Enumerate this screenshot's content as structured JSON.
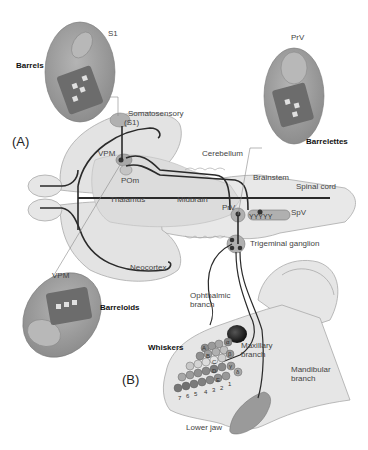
{
  "figure": {
    "panels": {
      "a": "(A)",
      "b": "(B)"
    },
    "insets": {
      "s1": {
        "region_label": "S1",
        "structure_label": "Barrels"
      },
      "prv": {
        "region_label": "PrV",
        "structure_label": "Barrelettes"
      },
      "vpm": {
        "region_label": "VPM",
        "structure_label": "Barreloids"
      }
    },
    "brain_labels": {
      "somatosensory": "Somatosensory",
      "s1": "(S1)",
      "vpm": "VPM",
      "pom": "POm",
      "thalamus": "Thalamus",
      "midbrain": "Midbrain",
      "cerebellum": "Cerebellum",
      "brainstem": "Brainstem",
      "spinal_cord": "Spinal cord",
      "prv": "PrV",
      "spv": "SpV",
      "neocortex": "Neocortex",
      "trigeminal_ganglion": "Trigeminal ganglion"
    },
    "head_labels": {
      "ophthalmic_1": "Ophthalmic",
      "ophthalmic_2": "branch",
      "whiskers": "Whiskers",
      "maxillary_1": "Maxillary",
      "maxillary_2": "branch",
      "mandibular_1": "Mandibular",
      "mandibular_2": "branch",
      "lower_jaw": "Lower jaw"
    },
    "whisker_rows": [
      "A",
      "B",
      "C",
      "D",
      "E"
    ],
    "whisker_arcs": [
      "1",
      "2",
      "3",
      "4",
      "5",
      "6",
      "7"
    ],
    "straddlers": [
      "α",
      "β",
      "γ",
      "δ"
    ],
    "colors": {
      "brain_fill": "#e3e3e3",
      "inset_fill": "#9a9a9a",
      "nucleus_fill": "#b0b0b0",
      "pathway": "#2a2a2a",
      "whisker_fill": "#8c8c8c",
      "whisker_light": "#dcdcdc"
    }
  }
}
